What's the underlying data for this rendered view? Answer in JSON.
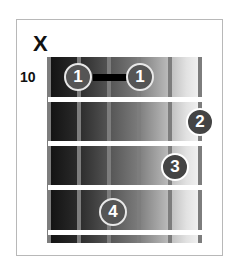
{
  "chord_diagram": {
    "muted_marker": "X",
    "start_fret": "10",
    "strings": 6,
    "frets_shown": 4,
    "fingers": [
      {
        "finger": "1",
        "string": 2,
        "fret": 1
      },
      {
        "finger": "1",
        "string": 4,
        "fret": 1
      },
      {
        "finger": "2",
        "string": 6,
        "fret": 2
      },
      {
        "finger": "3",
        "string": 5,
        "fret": 3
      },
      {
        "finger": "4",
        "string": 3,
        "fret": 4
      }
    ],
    "barre": {
      "from_string": 2,
      "to_string": 4,
      "fret": 1
    }
  }
}
